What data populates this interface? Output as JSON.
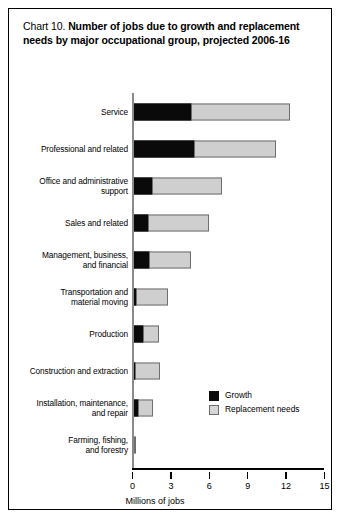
{
  "figure": {
    "title_lead": "Chart 10.",
    "title_strong": "Number of jobs due to growth and replacement needs by major occupational group, projected 2006-16"
  },
  "legend": {
    "position": "inside-right",
    "items": [
      {
        "name": "growth-swatch",
        "label": "Growth",
        "color": "#0a0a0a"
      },
      {
        "name": "replacement-swatch",
        "label": "Replacement needs",
        "color": "#d6d6d6"
      }
    ]
  },
  "axis": {
    "xlabel": "Millions of jobs",
    "ticks": [
      "0",
      "3",
      "6",
      "9",
      "12",
      "15"
    ]
  },
  "chart_data": {
    "type": "bar",
    "orientation": "horizontal",
    "stacked": true,
    "title": "Chart 10. Number of jobs due to growth and replacement needs by major occupational group, projected 2006-16",
    "xlabel": "Millions of jobs",
    "ylabel": "",
    "xlim": [
      0,
      15
    ],
    "xticks": [
      0,
      3,
      6,
      9,
      12,
      15
    ],
    "grid": false,
    "legend_position": "inside-right",
    "categories": [
      "Service",
      "Professional and related",
      "Office and administrative support",
      "Sales and related",
      "Management, business, and financial",
      "Transportation and material moving",
      "Production",
      "Construction and extraction",
      "Installation, maintenance, and repair",
      "Farming, fishing, and forestry"
    ],
    "series": [
      {
        "name": "Growth",
        "color": "#0a0a0a",
        "values": [
          4.6,
          4.8,
          1.5,
          1.2,
          1.3,
          0.3,
          0.85,
          0.1,
          0.4,
          0.0
        ]
      },
      {
        "name": "Replacement needs",
        "color": "#d6d6d6",
        "values": [
          7.7,
          6.4,
          5.5,
          4.8,
          3.3,
          2.5,
          1.25,
          2.0,
          1.2,
          0.15
        ]
      }
    ],
    "totals": [
      12.3,
      11.2,
      7.0,
      6.0,
      4.6,
      2.8,
      2.1,
      2.1,
      1.6,
      0.15
    ]
  },
  "rows": [
    {
      "label": "Service"
    },
    {
      "label": "Professional and related"
    },
    {
      "label": "Office and administrative\nsupport"
    },
    {
      "label": "Sales and related"
    },
    {
      "label": "Management, business,\nand financial"
    },
    {
      "label": "Transportation and\nmaterial moving"
    },
    {
      "label": "Production"
    },
    {
      "label": "Construction and extraction"
    },
    {
      "label": "Installation, maintenance,\nand repair"
    },
    {
      "label": "Farming, fishing,\nand forestry"
    }
  ]
}
